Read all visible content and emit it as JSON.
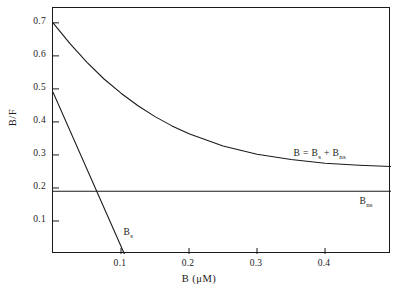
{
  "chart_data": {
    "type": "line",
    "title": "",
    "xlabel": "B (μM)",
    "ylabel": "B/F",
    "xlim": [
      0.0,
      0.497
    ],
    "ylim": [
      0.0,
      0.745
    ],
    "grid": false,
    "legend": "annotations-inline",
    "xticks": [
      "0.1",
      "0.2",
      "0.3",
      "0.4"
    ],
    "xtick_values": [
      0.1,
      0.2,
      0.3,
      0.4
    ],
    "yticks": [
      "0.1",
      "0.2",
      "0.3",
      "0.4",
      "0.5",
      "0.6",
      "0.7"
    ],
    "ytick_values": [
      0.1,
      0.2,
      0.3,
      0.4,
      0.5,
      0.6,
      0.7
    ],
    "series": [
      {
        "name": "B = B_s + B_ns",
        "label": "B = B",
        "label_sub1": "s",
        "label_mid": " + B",
        "label_sub2": "ns",
        "x": [
          0.0,
          0.025,
          0.05,
          0.075,
          0.1,
          0.125,
          0.15,
          0.175,
          0.2,
          0.25,
          0.3,
          0.35,
          0.4,
          0.45,
          0.497
        ],
        "values": [
          0.7,
          0.637,
          0.58,
          0.53,
          0.487,
          0.449,
          0.416,
          0.388,
          0.364,
          0.327,
          0.302,
          0.286,
          0.275,
          0.269,
          0.265
        ]
      },
      {
        "name": "B_ns",
        "label": "B",
        "label_sub1": "ns",
        "x": [
          0.0,
          0.497
        ],
        "values": [
          0.19,
          0.19
        ]
      },
      {
        "name": "B_s",
        "label": "B",
        "label_sub1": "s",
        "x": [
          0.0,
          0.105
        ],
        "values": [
          0.49,
          0.0
        ]
      }
    ],
    "annotations": [
      {
        "text": "B = B_s + B_ns",
        "x": 0.355,
        "y": 0.3
      },
      {
        "text": "B_ns",
        "x": 0.452,
        "y": 0.155
      },
      {
        "text": "B_s",
        "x": 0.105,
        "y": 0.062
      }
    ]
  },
  "axes": {
    "y_title": "B/F",
    "x_title": "B (μM)"
  }
}
